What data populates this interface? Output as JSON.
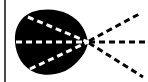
{
  "figure": {
    "name": "radial-beam-diagram",
    "width": 148,
    "height": 82,
    "background_color": "#ffffff",
    "ink_color": "#000000",
    "dash_color_inside_blob": "#ffffff",
    "dash_color_outside_blob": "#000000",
    "left_rule_color": "#4a4a4a"
  },
  "left_rule": {
    "label": "",
    "x": 5,
    "y_top": 0,
    "y_bottom": 82,
    "thickness": 2
  },
  "blob": {
    "label": "",
    "description": "solid black teardrop region",
    "fill": "#000000",
    "apex_x": 88,
    "apex_y": 42,
    "left_x": 15,
    "top_y": 10,
    "bottom_y": 74
  },
  "vertex": {
    "label": "",
    "x": 88,
    "y": 42
  },
  "rays": [
    {
      "name": "upper-ray",
      "label": "",
      "inner_start_x": 28,
      "inner_start_y": 17,
      "outer_end_x": 141,
      "outer_end_y": 13
    },
    {
      "name": "center-ray",
      "label": "",
      "inner_start_x": 16,
      "inner_start_y": 42,
      "outer_end_x": 148,
      "outer_end_y": 42
    },
    {
      "name": "lower-ray",
      "label": "",
      "inner_start_x": 30,
      "inner_start_y": 69,
      "outer_end_x": 143,
      "outer_end_y": 77
    }
  ],
  "dash_pattern": {
    "dash_length": 6,
    "gap_length": 4,
    "stroke_width": 3
  }
}
